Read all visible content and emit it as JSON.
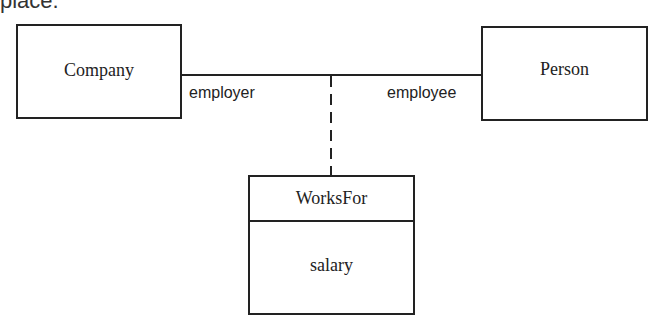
{
  "header_fragment": "place.",
  "diagram": {
    "classes": [
      {
        "name": "Company"
      },
      {
        "name": "Person"
      }
    ],
    "association_class": {
      "name": "WorksFor",
      "attributes": [
        "salary"
      ]
    },
    "roles": {
      "left": "employer",
      "right": "employee"
    }
  }
}
